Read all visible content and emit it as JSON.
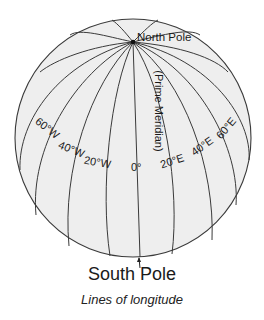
{
  "diagram": {
    "caption": "Lines of longitude",
    "north_pole_label": "North Pole",
    "south_pole_label": "South Pole",
    "prime_meridian_label": "(Prime Meridian)",
    "longitude_labels": {
      "w60": "60°W",
      "w40": "40°W",
      "w20": "20°W",
      "zero": "0°",
      "e20": "20°E",
      "e40": "40°E",
      "e60": "60°E"
    },
    "colors": {
      "globe_fill": "#eeeeee",
      "line": "#3a3a3a",
      "text": "#1a1a1a"
    }
  }
}
